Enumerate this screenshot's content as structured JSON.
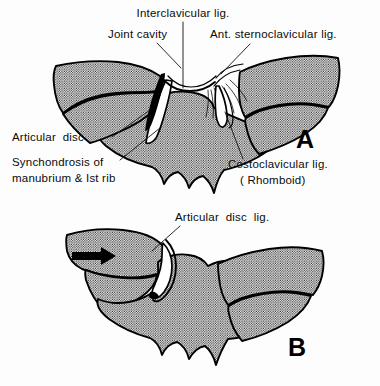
{
  "figure": {
    "background_color": "#fdfdfd",
    "ink_color": "#000000"
  },
  "panels": [
    {
      "id": "A",
      "letter": "A",
      "letter_x": 296,
      "letter_y": 148,
      "caption": "Normal sternoclavicular joint"
    },
    {
      "id": "B",
      "letter": "B",
      "letter_x": 288,
      "letter_y": 356,
      "caption": "Sternoclavicular joint with medial displacing force"
    }
  ],
  "labels": [
    {
      "id": "interclavicular",
      "text": "Interclavicular lig.",
      "x": 183,
      "y": 17,
      "anchor": "middle",
      "panel": "A",
      "leader": "M 183,22 L 183,88"
    },
    {
      "id": "joint-cavity",
      "text": "Joint cavity",
      "x": 108,
      "y": 38,
      "anchor": "start",
      "panel": "A",
      "leader": "M 155,43 L 182,66"
    },
    {
      "id": "ant-sternoclavicular",
      "text": "Ant. sternoclavicular lig.",
      "x": 210,
      "y": 38,
      "anchor": "start",
      "panel": "A",
      "leader": "M 248,43 L 222,73"
    },
    {
      "id": "articular-disc",
      "text": "Articular  disc",
      "x": 12,
      "y": 141,
      "anchor": "start",
      "panel": "A",
      "leader": "M 112,137 L 147,112"
    },
    {
      "id": "synchondrosis",
      "text": "Synchondrosis of",
      "x": 12,
      "y": 166,
      "anchor": "start",
      "panel": "A",
      "leader": "M 118,160 L 158,129"
    },
    {
      "id": "synchondrosis-line2",
      "text": "manubrium & Ist rib",
      "x": 12,
      "y": 182,
      "anchor": "start",
      "panel": "A",
      "leader": ""
    },
    {
      "id": "costoclavicular",
      "text": "Costoclavicular lig.",
      "x": 228,
      "y": 168,
      "anchor": "start",
      "panel": "A",
      "leader": "M 243,160 L 226,112"
    },
    {
      "id": "costoclavicular-line2",
      "text": "( Rhomboid)",
      "x": 240,
      "y": 184,
      "anchor": "start",
      "panel": "A",
      "leader": ""
    },
    {
      "id": "articular-disc-lig",
      "text": "Articular  disc  lig.",
      "x": 175,
      "y": 221,
      "anchor": "start",
      "panel": "B",
      "leader": "M 178,226 L 152,250"
    }
  ],
  "annotations": [
    {
      "id": "force-arrow",
      "type": "arrow",
      "direction": "right",
      "panel": "B",
      "description": "Medially directed force applied to clavicle",
      "x": 88,
      "y": 256
    }
  ],
  "structures": [
    {
      "id": "manubrium",
      "name": "Manubrium of sternum",
      "fill": "stipple"
    },
    {
      "id": "left-clavicle",
      "name": "Left clavicle",
      "fill": "stipple"
    },
    {
      "id": "right-clavicle",
      "name": "Right clavicle",
      "fill": "stipple"
    },
    {
      "id": "first-rib-left",
      "name": "First rib (left)",
      "fill": "stipple"
    },
    {
      "id": "first-rib-right",
      "name": "First rib (right)",
      "fill": "stipple"
    },
    {
      "id": "articular-disc-structure",
      "name": "Articular disc",
      "fill": "white"
    },
    {
      "id": "joint-cavity-structure",
      "name": "Joint cavity",
      "fill": "black"
    }
  ]
}
